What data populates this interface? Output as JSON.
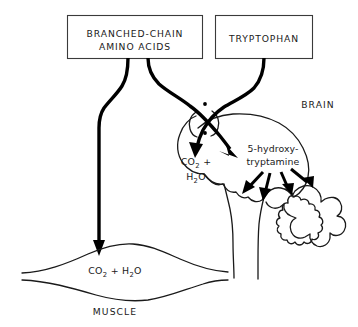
{
  "figure": {
    "background_color": "#ffffff",
    "line_color": "#000000",
    "box_stroke_color": "#3a3a3a"
  },
  "boxes": [
    {
      "id": "branched-chain-amino-acids",
      "line1": "BRANCHED-CHAIN",
      "line2": "AMINO ACIDS"
    },
    {
      "id": "tryptophan",
      "line1": "TRYPTOPHAN"
    }
  ],
  "regions": {
    "brain_label": "BRAIN",
    "muscle_label": "MUSCLE"
  },
  "metabolites": {
    "brain_co2": {
      "line1_main": "CO",
      "line1_sub": "2",
      "line1_tail": " +",
      "line2_main": "H",
      "line2_sub": "2",
      "line2_tail": "O"
    },
    "muscle_co2": {
      "main1": "CO",
      "sub1": "2",
      "mid": " + H",
      "sub2": "2",
      "tail": "O"
    },
    "serotonin": {
      "line1": "5-hydroxy-",
      "line2": "tryptamine"
    }
  },
  "flows": [
    {
      "id": "bcaa-to-muscle",
      "from": "BRANCHED-CHAIN AMINO ACIDS",
      "to": "MUSCLE"
    },
    {
      "id": "bcaa-to-brain",
      "from": "BRANCHED-CHAIN AMINO ACIDS",
      "to": "BRAIN 5-hydroxytryptamine"
    },
    {
      "id": "tryptophan-to-brain-co2",
      "from": "TRYPTOPHAN",
      "to": "BRAIN CO2 + H2O"
    },
    {
      "id": "serotonin-projection-1",
      "from": "5-hydroxytryptamine",
      "to": "brain regions"
    },
    {
      "id": "serotonin-projection-2",
      "from": "5-hydroxytryptamine",
      "to": "brain regions"
    },
    {
      "id": "serotonin-projection-3",
      "from": "5-hydroxytryptamine",
      "to": "brain regions"
    },
    {
      "id": "serotonin-projection-4",
      "from": "5-hydroxytryptamine",
      "to": "cerebellum"
    }
  ]
}
